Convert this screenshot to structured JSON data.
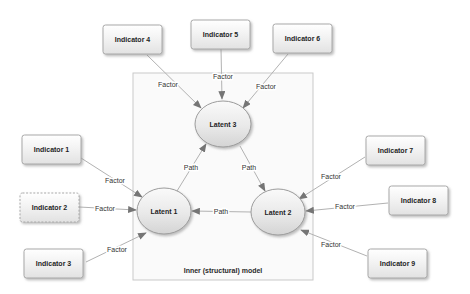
{
  "diagram": {
    "inner_model_label": "Inner (structural) model",
    "latents": [
      {
        "id": "latent1",
        "label": "Latent 1"
      },
      {
        "id": "latent2",
        "label": "Latent 2"
      },
      {
        "id": "latent3",
        "label": "Latent 3"
      }
    ],
    "indicators": [
      {
        "id": "indicator1",
        "label": "Indicator 1"
      },
      {
        "id": "indicator2",
        "label": "Indicator 2"
      },
      {
        "id": "indicator3",
        "label": "Indicator 3"
      },
      {
        "id": "indicator4",
        "label": "Indicator 4"
      },
      {
        "id": "indicator5",
        "label": "Indicator 5"
      },
      {
        "id": "indicator6",
        "label": "Indicator 6"
      },
      {
        "id": "indicator7",
        "label": "Indicator 7"
      },
      {
        "id": "indicator8",
        "label": "Indicator 8"
      },
      {
        "id": "indicator9",
        "label": "Indicator 9"
      }
    ],
    "edges": [
      {
        "from": "indicator4",
        "to": "latent3",
        "label": "Factor"
      },
      {
        "from": "indicator5",
        "to": "latent3",
        "label": "Factor"
      },
      {
        "from": "indicator6",
        "to": "latent3",
        "label": "Factor"
      },
      {
        "from": "indicator1",
        "to": "latent1",
        "label": "Factor"
      },
      {
        "from": "indicator2",
        "to": "latent1",
        "label": "Factor"
      },
      {
        "from": "indicator3",
        "to": "latent1",
        "label": "Factor"
      },
      {
        "from": "indicator7",
        "to": "latent2",
        "label": "Factor"
      },
      {
        "from": "indicator8",
        "to": "latent2",
        "label": "Factor"
      },
      {
        "from": "indicator9",
        "to": "latent2",
        "label": "Factor"
      },
      {
        "from": "latent1",
        "to": "latent3",
        "label": "Path"
      },
      {
        "from": "latent3",
        "to": "latent2",
        "label": "Path"
      },
      {
        "from": "latent2",
        "to": "latent1",
        "label": "Path"
      }
    ],
    "colors": {
      "background": "#ffffff",
      "box_fill_top": "#ffffff",
      "box_fill_bottom": "#e2e2e2",
      "box_border": "#a8a8a8",
      "ellipse_border": "#9c9c9c",
      "inner_box_fill": "#fafafa",
      "inner_box_border": "#c9c9c9",
      "line": "#b2b2b2",
      "arrowhead": "#757575",
      "text": "#1f1f1f"
    }
  }
}
